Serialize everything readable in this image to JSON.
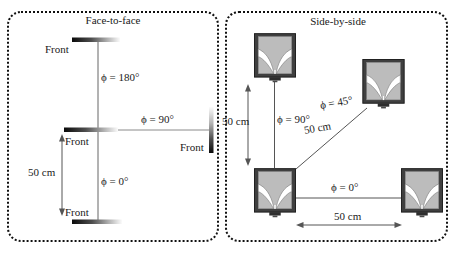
{
  "figure": {
    "left_panel": {
      "title": "Face-to-face",
      "front_top": "Front",
      "front_middle": "Front",
      "front_right": "Front",
      "front_bottom": "Front",
      "angle_180": "ϕ = 180°",
      "angle_90": "ϕ = 90°",
      "angle_0": "ϕ = 0°",
      "distance": "50 cm"
    },
    "right_panel": {
      "title": "Side-by-side",
      "angle_90": "ϕ = 90°",
      "angle_45": "ϕ = 45°",
      "angle_0": "ϕ = 0°",
      "distance_vertical": "50 cm",
      "distance_diagonal": "50 cm",
      "distance_horizontal": "50 cm"
    },
    "colors": {
      "panel_border": "#111111",
      "line": "#555555",
      "text": "#1a1a1a",
      "device_dark": "#0a0a0a",
      "device_light": "#fbfbfb",
      "speaker_frame": "#3f3f3f",
      "speaker_fill": "#bcbcbc",
      "speaker_horn": "#ffffff"
    }
  }
}
